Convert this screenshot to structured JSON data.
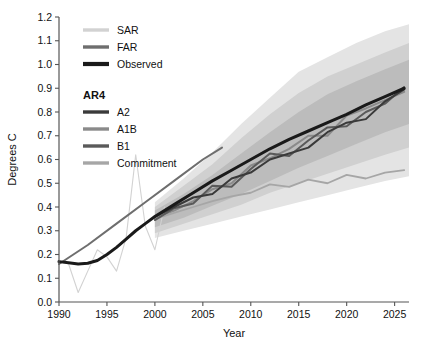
{
  "chart_data": {
    "type": "line",
    "title": "",
    "xlabel": "Year",
    "ylabel": "Degrees C",
    "xlim": [
      1990,
      2026.5
    ],
    "ylim": [
      0.0,
      1.2
    ],
    "xticks": [
      1990,
      1995,
      2000,
      2005,
      2010,
      2015,
      2020,
      2025
    ],
    "yticks": [
      0.0,
      0.1,
      0.2,
      0.3,
      0.4,
      0.5,
      0.6,
      0.7,
      0.8,
      0.9,
      1.0,
      1.1,
      1.2
    ],
    "grid": false,
    "legend_position": "upper-left",
    "colors": {
      "sar": "#d2d2d2",
      "far": "#6e6e6e",
      "observed": "#1a1a1a",
      "a2": "#3a3a3a",
      "a1b": "#8a8a8a",
      "b1": "#5a5a5a",
      "commitment": "#a6a6a6",
      "band_outer": "#e4e4e4",
      "band_mid": "#d0d0d0",
      "band_inner": "#bcbcbc",
      "axis": "#555555"
    },
    "series": [
      {
        "name": "SAR",
        "x": [
          1990,
          1991,
          1992,
          1993,
          1994,
          1995,
          1996,
          1997,
          1998,
          1999,
          2000,
          2001
        ],
        "values": [
          0.17,
          0.16,
          0.04,
          0.13,
          0.22,
          0.19,
          0.13,
          0.27,
          0.62,
          0.32,
          0.22,
          0.4
        ]
      },
      {
        "name": "FAR",
        "x": [
          1990,
          1993,
          1996,
          1999,
          2002,
          2005,
          2007
        ],
        "values": [
          0.16,
          0.24,
          0.33,
          0.42,
          0.51,
          0.6,
          0.65
        ]
      },
      {
        "name": "Observed",
        "x": [
          1990,
          1991,
          1992,
          1993,
          1994,
          1995,
          1996,
          1997,
          1998,
          1999,
          2000,
          2002,
          2004,
          2006,
          2008,
          2010,
          2012,
          2014,
          2016,
          2018,
          2020,
          2022,
          2024,
          2026
        ],
        "values": [
          0.17,
          0.165,
          0.16,
          0.163,
          0.175,
          0.2,
          0.23,
          0.265,
          0.3,
          0.33,
          0.36,
          0.41,
          0.46,
          0.51,
          0.555,
          0.6,
          0.645,
          0.685,
          0.72,
          0.755,
          0.79,
          0.83,
          0.865,
          0.9
        ]
      },
      {
        "name": "A2",
        "x": [
          2000,
          2002,
          2004,
          2006,
          2008,
          2010,
          2012,
          2014,
          2016,
          2018,
          2020,
          2022,
          2024,
          2026
        ],
        "values": [
          0.36,
          0.4,
          0.44,
          0.455,
          0.52,
          0.545,
          0.6,
          0.625,
          0.65,
          0.715,
          0.755,
          0.77,
          0.845,
          0.895
        ]
      },
      {
        "name": "A1B",
        "x": [
          2000,
          2002,
          2004,
          2006,
          2008,
          2010,
          2012,
          2014,
          2016,
          2018,
          2020,
          2022,
          2024,
          2026
        ],
        "values": [
          0.355,
          0.385,
          0.425,
          0.475,
          0.5,
          0.575,
          0.605,
          0.645,
          0.7,
          0.7,
          0.785,
          0.815,
          0.85,
          0.885
        ]
      },
      {
        "name": "B1",
        "x": [
          2000,
          2002,
          2004,
          2006,
          2008,
          2010,
          2012,
          2014,
          2016,
          2018,
          2020,
          2022,
          2024,
          2026
        ],
        "values": [
          0.345,
          0.395,
          0.415,
          0.49,
          0.485,
          0.56,
          0.625,
          0.615,
          0.68,
          0.735,
          0.74,
          0.8,
          0.835,
          0.905
        ]
      },
      {
        "name": "Commitment",
        "x": [
          2000,
          2002,
          2004,
          2006,
          2008,
          2010,
          2012,
          2014,
          2016,
          2018,
          2020,
          2022,
          2024,
          2026
        ],
        "values": [
          0.35,
          0.375,
          0.4,
          0.425,
          0.445,
          0.46,
          0.495,
          0.485,
          0.515,
          0.5,
          0.535,
          0.52,
          0.545,
          0.555
        ]
      }
    ],
    "bands": [
      {
        "name": "outer-envelope",
        "x": [
          2000,
          2003,
          2006,
          2009,
          2012,
          2015,
          2018,
          2021,
          2024,
          2026.5
        ],
        "upper": [
          0.42,
          0.52,
          0.63,
          0.75,
          0.86,
          0.97,
          1.03,
          1.09,
          1.14,
          1.17
        ],
        "lower": [
          0.27,
          0.3,
          0.33,
          0.36,
          0.39,
          0.42,
          0.45,
          0.48,
          0.51,
          0.53
        ]
      },
      {
        "name": "mid-envelope",
        "x": [
          2000,
          2003,
          2006,
          2009,
          2012,
          2015,
          2018,
          2021,
          2024,
          2026.5
        ],
        "upper": [
          0.4,
          0.49,
          0.58,
          0.69,
          0.79,
          0.88,
          0.95,
          1.0,
          1.05,
          1.09
        ],
        "lower": [
          0.29,
          0.33,
          0.37,
          0.41,
          0.46,
          0.5,
          0.54,
          0.58,
          0.62,
          0.65
        ]
      },
      {
        "name": "inner-envelope",
        "x": [
          2000,
          2003,
          2006,
          2009,
          2012,
          2015,
          2018,
          2021,
          2024,
          2026.5
        ],
        "upper": [
          0.385,
          0.455,
          0.535,
          0.625,
          0.715,
          0.8,
          0.875,
          0.93,
          0.98,
          1.02
        ],
        "lower": [
          0.315,
          0.355,
          0.405,
          0.455,
          0.51,
          0.565,
          0.615,
          0.665,
          0.715,
          0.75
        ]
      }
    ]
  },
  "legend": {
    "groups": [
      {
        "heading": "",
        "items": [
          {
            "label": "SAR",
            "color_key": "sar"
          },
          {
            "label": "FAR",
            "color_key": "far"
          },
          {
            "label": "Observed",
            "color_key": "observed"
          }
        ]
      },
      {
        "heading": "AR4",
        "items": [
          {
            "label": "A2",
            "color_key": "a2"
          },
          {
            "label": "A1B",
            "color_key": "a1b"
          },
          {
            "label": "B1",
            "color_key": "b1"
          },
          {
            "label": "Commitment",
            "color_key": "commitment"
          }
        ]
      }
    ]
  }
}
